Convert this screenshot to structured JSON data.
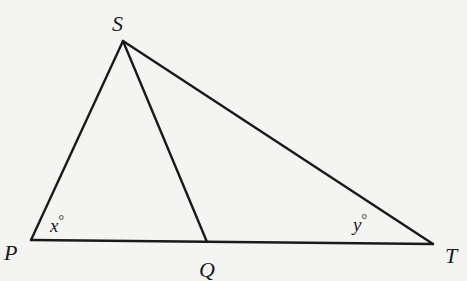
{
  "figure": {
    "vertices": {
      "S": {
        "label": "S",
        "x": 123,
        "y": 41
      },
      "P": {
        "label": "P",
        "x": 31,
        "y": 240
      },
      "Q": {
        "label": "Q",
        "x": 207,
        "y": 242
      },
      "T": {
        "label": "T",
        "x": 433,
        "y": 244
      }
    },
    "segments": [
      "SP",
      "SQ",
      "ST",
      "PT"
    ],
    "angles": {
      "x": {
        "variable": "x",
        "unit": "°",
        "at": "P"
      },
      "y": {
        "variable": "y",
        "unit": "°",
        "at": "T"
      }
    }
  }
}
